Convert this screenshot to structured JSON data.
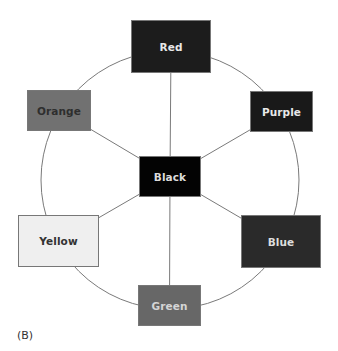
{
  "figure": {
    "caption": "(B)",
    "circle": {
      "cx": 170,
      "cy": 180,
      "r": 129,
      "stroke": "#7a7a7a"
    },
    "center_node": "black",
    "nodes": {
      "red": {
        "label": "Red",
        "x": 131,
        "y": 20,
        "w": 80,
        "h": 53,
        "fill": "#1c1c1c",
        "text": "#e8e8e8"
      },
      "orange": {
        "label": "Orange",
        "x": 27,
        "y": 90,
        "w": 64,
        "h": 41,
        "fill": "#717171",
        "text": "#2e2e2e"
      },
      "purple": {
        "label": "Purple",
        "x": 250,
        "y": 91,
        "w": 63,
        "h": 41,
        "fill": "#191919",
        "text": "#e8e8e8"
      },
      "black": {
        "label": "Black",
        "x": 139,
        "y": 156,
        "w": 62,
        "h": 41,
        "fill": "#030303",
        "text": "#dcdcdc"
      },
      "yellow": {
        "label": "Yellow",
        "x": 18,
        "y": 215,
        "w": 81,
        "h": 52,
        "fill": "#efefef",
        "text": "#333333"
      },
      "blue": {
        "label": "Blue",
        "x": 241,
        "y": 215,
        "w": 80,
        "h": 53,
        "fill": "#2a2a2a",
        "text": "#dddddd"
      },
      "green": {
        "label": "Green",
        "x": 138,
        "y": 285,
        "w": 63,
        "h": 41,
        "fill": "#676767",
        "text": "#d5d5d5"
      }
    },
    "spokes": [
      "red",
      "orange",
      "purple",
      "yellow",
      "blue",
      "green"
    ]
  }
}
